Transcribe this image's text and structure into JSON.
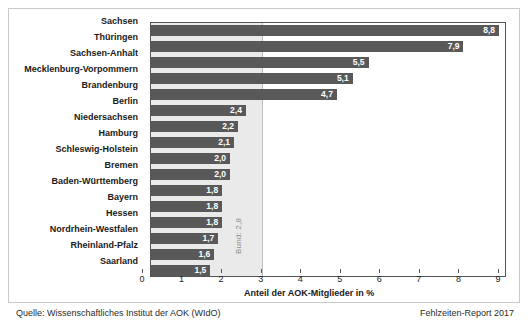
{
  "chart_data": {
    "type": "bar",
    "orientation": "horizontal",
    "title": "",
    "xlabel": "Anteil der AOK-Mitglieder in %",
    "ylabel": "",
    "xlim": [
      0,
      9
    ],
    "xticks": [
      "0",
      "1",
      "2",
      "3",
      "4",
      "5",
      "6",
      "7",
      "8",
      "9"
    ],
    "grid": false,
    "legend": "none",
    "categories": [
      "Sachsen",
      "Thüringen",
      "Sachsen-Anhalt",
      "Mecklenburg-Vorpommern",
      "Brandenburg",
      "Berlin",
      "Niedersachsen",
      "Hamburg",
      "Schleswig-Holstein",
      "Bremen",
      "Baden-Württemberg",
      "Bayern",
      "Hessen",
      "Nordrhein-Westfalen",
      "Rheinland-Pfalz",
      "Saarland"
    ],
    "values": [
      8.8,
      7.9,
      5.5,
      5.1,
      4.7,
      2.4,
      2.2,
      2.1,
      2.0,
      2.0,
      1.8,
      1.8,
      1.8,
      1.7,
      1.6,
      1.5
    ],
    "value_labels": [
      "8,8",
      "7,9",
      "5,5",
      "5,1",
      "4,7",
      "2,4",
      "2,2",
      "2,1",
      "2,0",
      "2,0",
      "1,8",
      "1,8",
      "1,8",
      "1,7",
      "1,6",
      "1,5"
    ],
    "annotations": [
      {
        "name": "national-average",
        "label": "Bund: 2,8",
        "value": 2.8
      }
    ],
    "colors": {
      "bar": "#595959",
      "value_text": "#ffffff",
      "band": "#eaeaea",
      "axis": "#555555",
      "frame": "#c9c9c9",
      "text": "#1a1a1a",
      "annotation_text": "#8a8a8a"
    }
  },
  "footer": {
    "source": "Quelle: Wissenschaftliches Institut der AOK (WIdO)",
    "report": "Fehlzeiten-Report 2017"
  }
}
